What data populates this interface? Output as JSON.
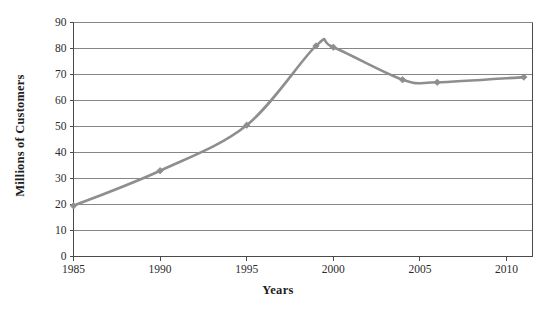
{
  "chart_data": {
    "type": "line",
    "title": "",
    "subtitle": "",
    "xlabel": "Years",
    "ylabel": "Millions of Customers",
    "xlim": [
      1985,
      2011.5
    ],
    "ylim": [
      0,
      90
    ],
    "grid": "horizontal",
    "legend": "none",
    "x_ticks": [
      1985,
      1990,
      1995,
      2000,
      2005,
      2010
    ],
    "x_tick_labels": [
      "1985",
      "1990",
      "1995",
      "2000",
      "2005",
      "2010"
    ],
    "y_ticks": [
      0,
      10,
      20,
      30,
      40,
      50,
      60,
      70,
      80,
      90
    ],
    "y_tick_labels": [
      "0",
      "10",
      "20",
      "30",
      "40",
      "50",
      "60",
      "70",
      "80",
      "90"
    ],
    "series": [
      {
        "name": "Customers",
        "color": "#8e8e8e",
        "marker": "diamond",
        "x": [
          1985,
          1990,
          1995,
          1999,
          2000,
          2004,
          2006,
          2011
        ],
        "values": [
          19.5,
          33,
          50.5,
          81,
          80.5,
          68,
          67,
          69
        ]
      }
    ]
  },
  "axes": {
    "x_title": "Years",
    "y_title": "Millions of Customers"
  },
  "style": {
    "line_color": "#8e8e8e",
    "marker_color": "#8e8e8e",
    "grid_color": "#868686",
    "axis_color": "#4a4a4a",
    "text_color": "#2b2b2b",
    "background": "#ffffff"
  }
}
